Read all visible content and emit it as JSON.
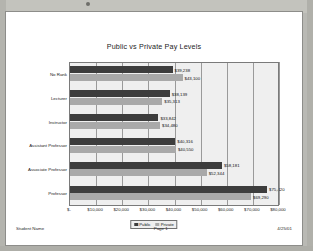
{
  "document": {
    "footer_left": "Student Name",
    "footer_center": "Page 1",
    "footer_right": "4/25/01"
  },
  "chart_data": {
    "type": "bar",
    "orientation": "horizontal",
    "title": "Public vs Private Pay Levels",
    "xlabel": "",
    "ylabel": "",
    "xlim": [
      0,
      80000
    ],
    "grid": true,
    "legend_position": "bottom",
    "tick_labels": [
      "$-",
      "$10,000",
      "$20,000",
      "$30,000",
      "$40,000",
      "$50,000",
      "$60,000",
      "$70,000",
      "$80,000"
    ],
    "tick_values": [
      0,
      10000,
      20000,
      30000,
      40000,
      50000,
      60000,
      70000,
      80000
    ],
    "categories": [
      "No Rank",
      "Lecturer",
      "Instructor",
      "Assistant Professor",
      "Associate Professor",
      "Professor"
    ],
    "series": [
      {
        "name": "Public",
        "color": "#3d3d3d",
        "values": [
          39238,
          38139,
          33842,
          40316,
          58181,
          75420
        ],
        "labels": [
          "$39,238",
          "$38,139",
          "$33,842",
          "$40,316",
          "$58,181",
          "$75,420"
        ]
      },
      {
        "name": "Private",
        "color": "#a9a9a9",
        "values": [
          43100,
          35313,
          34480,
          40550,
          52344,
          69290
        ],
        "labels": [
          "$43,100",
          "$35,313",
          "$34,480",
          "$40,550",
          "$52,344",
          "$69,290"
        ]
      }
    ]
  }
}
